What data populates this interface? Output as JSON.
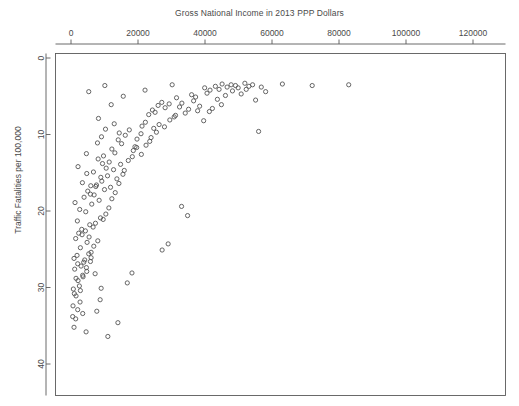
{
  "chart_data": {
    "type": "scatter",
    "title": "Gross National Income in 2013 PPP Dollars",
    "xlabel": "",
    "ylabel": "Traffic Fatalities per 100,000",
    "xlim": [
      -4000,
      132000
    ],
    "ylim": [
      0,
      43
    ],
    "y_inverted": true,
    "x_axis_position": "top",
    "grid": false,
    "legend": null,
    "marker": "open-circle",
    "marker_color": "#555555",
    "xticks": [
      0,
      20000,
      40000,
      60000,
      80000,
      100000,
      120000
    ],
    "xtick_labels": [
      "0",
      "20000",
      "40000",
      "60000",
      "80000",
      "100000",
      "120000"
    ],
    "yticks": [
      0,
      10,
      20,
      30,
      40
    ],
    "ytick_labels": [
      "0",
      "10",
      "20",
      "30",
      "40"
    ],
    "x": [
      10100,
      5300,
      15600,
      22100,
      12000,
      8200,
      12900,
      10300,
      9100,
      30200,
      31500,
      36000,
      37200,
      39900,
      40600,
      41500,
      43100,
      44200,
      45100,
      46100,
      46600,
      47800,
      48200,
      49100,
      49900,
      50800,
      51900,
      52300,
      53100,
      54200,
      55100,
      56800,
      58100,
      56000,
      63100,
      72000,
      82900,
      4600,
      7900,
      9400,
      14400,
      19100,
      21200,
      23200,
      24300,
      25100,
      26000,
      27100,
      28100,
      29300,
      30800,
      32400,
      33100,
      34100,
      35100,
      36600,
      37800,
      38400,
      39600,
      41300,
      42200,
      43700,
      44900,
      2100,
      3400,
      4700,
      5800,
      6700,
      7400,
      8100,
      8900,
      9700,
      10500,
      11400,
      12200,
      13100,
      14100,
      15100,
      16200,
      17400,
      18600,
      19700,
      20900,
      22200,
      23500,
      24700,
      26300,
      27900,
      29500,
      31200,
      33000,
      34800,
      1200,
      1900,
      2600,
      3200,
      3900,
      4400,
      5000,
      5600,
      6200,
      6900,
      7600,
      8400,
      9200,
      10000,
      10900,
      11800,
      12700,
      13700,
      14800,
      15900,
      17100,
      18300,
      19600,
      21000,
      22400,
      23900,
      25500,
      27200,
      29000,
      900,
      1400,
      1800,
      2300,
      2800,
      3300,
      3800,
      4300,
      4800,
      5400,
      6000,
      6600,
      7300,
      8000,
      8800,
      9600,
      10400,
      11300,
      12200,
      13200,
      14300,
      15500,
      16800,
      18200,
      700,
      1100,
      1500,
      2000,
      2500,
      3000,
      3500,
      4100,
      4700,
      5300,
      6000,
      6800,
      7700,
      8700,
      600,
      1000,
      1500,
      2100,
      2800,
      3600,
      4600,
      5800,
      7200,
      9000,
      11000,
      14000,
      500,
      900,
      1400,
      2000,
      2700,
      3500,
      4500,
      5900,
      8000,
      125400
    ],
    "y": [
      3.6,
      4.4,
      5.0,
      4.2,
      6.1,
      7.9,
      8.6,
      9.3,
      10.3,
      3.5,
      5.2,
      4.8,
      5.1,
      3.9,
      4.6,
      4.2,
      3.7,
      4.1,
      3.4,
      4.9,
      3.8,
      3.5,
      4.3,
      3.6,
      3.9,
      4.7,
      3.3,
      4.1,
      3.7,
      3.5,
      5.5,
      3.8,
      4.4,
      9.6,
      3.4,
      3.6,
      3.5,
      12.5,
      11.1,
      13.8,
      9.8,
      11.6,
      8.9,
      7.4,
      6.8,
      7.1,
      6.2,
      5.8,
      6.5,
      6.0,
      7.7,
      6.4,
      5.9,
      7.2,
      6.7,
      5.6,
      6.9,
      6.3,
      8.2,
      7.0,
      6.6,
      5.4,
      6.1,
      14.2,
      16.3,
      15.1,
      17.8,
      14.9,
      16.8,
      13.2,
      15.6,
      12.8,
      14.4,
      13.6,
      11.9,
      12.4,
      10.7,
      11.2,
      10.1,
      9.4,
      12.1,
      10.6,
      9.9,
      8.4,
      10.9,
      9.2,
      8.7,
      9.0,
      8.1,
      7.5,
      19.4,
      20.6,
      18.9,
      21.3,
      19.8,
      22.4,
      18.2,
      20.1,
      17.4,
      21.8,
      19.1,
      17.9,
      16.6,
      18.6,
      16.1,
      17.2,
      15.4,
      16.9,
      14.6,
      15.8,
      13.9,
      14.7,
      13.4,
      12.9,
      11.7,
      12.6,
      11.4,
      10.4,
      9.7,
      25.1,
      24.3,
      26.2,
      23.6,
      25.8,
      22.9,
      24.8,
      23.1,
      26.7,
      22.6,
      24.1,
      23.4,
      25.4,
      22.1,
      21.6,
      23.9,
      20.9,
      21.1,
      20.4,
      19.6,
      18.4,
      17.6,
      16.4,
      15.2,
      29.4,
      28.1,
      30.2,
      27.6,
      28.8,
      26.9,
      29.8,
      27.2,
      28.4,
      26.4,
      27.9,
      25.6,
      26.1,
      24.6,
      33.1,
      31.6,
      32.4,
      30.8,
      31.1,
      29.1,
      30.4,
      28.6,
      27.4,
      26.6,
      28.2,
      30.1,
      36.4,
      34.6,
      33.8,
      35.2,
      34.1,
      32.9,
      31.9,
      33.4,
      35.8,
      16.7
    ]
  }
}
